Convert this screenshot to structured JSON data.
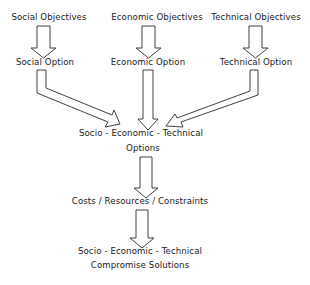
{
  "diagram": {
    "type": "flowchart",
    "objectives": [
      {
        "id": "social",
        "label": "Social Objectives"
      },
      {
        "id": "economic",
        "label": "Economic Objectives"
      },
      {
        "id": "technical",
        "label": "Technical Objectives"
      }
    ],
    "options": [
      {
        "id": "social",
        "label": "Social Option"
      },
      {
        "id": "economic",
        "label": "Economic Option"
      },
      {
        "id": "technical",
        "label": "Technical Option"
      }
    ],
    "combined_options": {
      "line1": "Socio - Economic - Technical",
      "line2": "Options"
    },
    "constraints": {
      "label": "Costs / Resources / Constraints"
    },
    "result": {
      "line1": "Socio - Economic - Technical",
      "line2": "Compromise  Solutions"
    },
    "edges": [
      {
        "from": "Social Objectives",
        "to": "Social Option"
      },
      {
        "from": "Economic Objectives",
        "to": "Economic Option"
      },
      {
        "from": "Technical Objectives",
        "to": "Technical Option"
      },
      {
        "from": "Social Option",
        "to": "Socio-Economic-Technical Options"
      },
      {
        "from": "Economic Option",
        "to": "Socio-Economic-Technical Options"
      },
      {
        "from": "Technical Option",
        "to": "Socio-Economic-Technical Options"
      },
      {
        "from": "Socio-Economic-Technical Options",
        "to": "Costs/Resources/Constraints"
      },
      {
        "from": "Costs/Resources/Constraints",
        "to": "Socio-Economic-Technical Compromise Solutions"
      }
    ],
    "stroke_color": "#2a2a2a"
  }
}
